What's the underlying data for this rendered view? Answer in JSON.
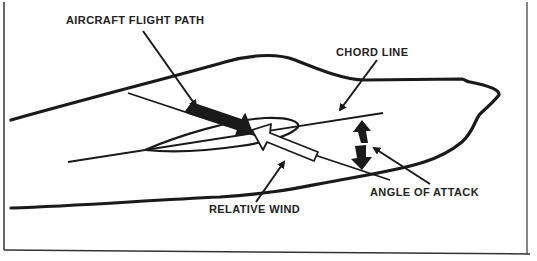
{
  "diagram": {
    "labels": {
      "flight_path": "AIRCRAFT FLIGHT PATH",
      "chord_line": "CHORD LINE",
      "angle_of_attack": "ANGLE OF ATTACK",
      "relative_wind": "RELATIVE WIND"
    },
    "colors": {
      "ink": "#1a1a1a",
      "background": "#ffffff",
      "frame": "#333333"
    },
    "elements": [
      "aircraft-silhouette-outline",
      "airfoil-cross-section",
      "chord-line",
      "flight-path-arrow (solid black)",
      "relative-wind-arrow (hollow white)",
      "angle-of-attack-double-arrow",
      "leader-arrows"
    ]
  }
}
